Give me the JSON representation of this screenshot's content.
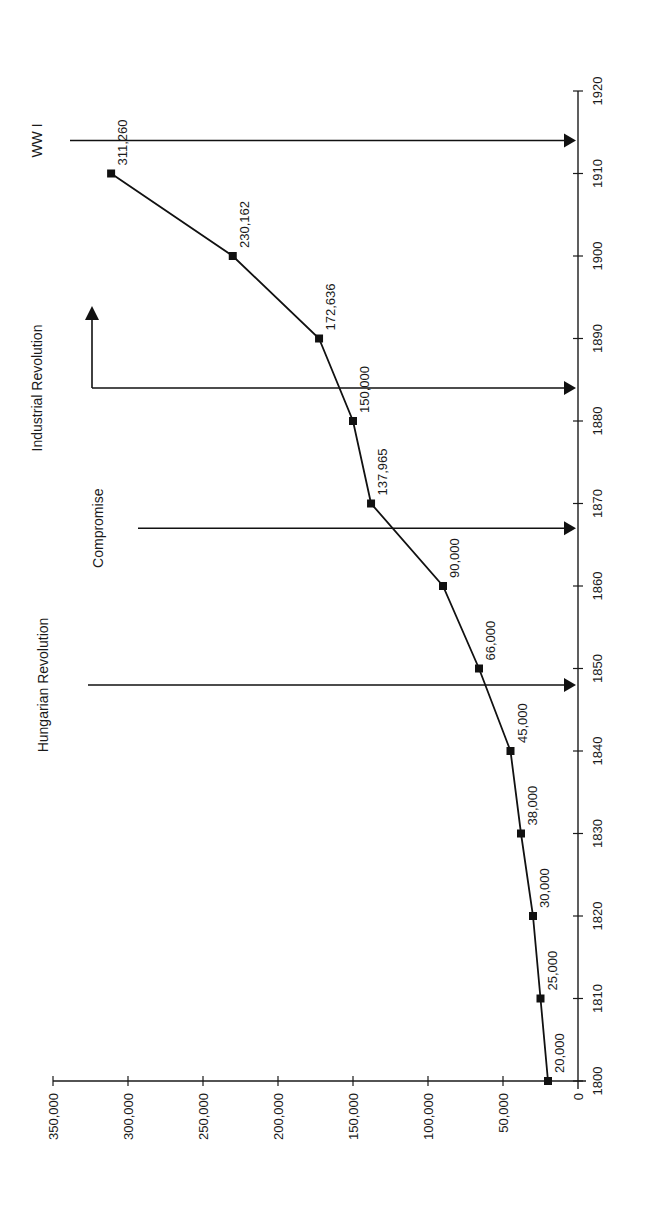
{
  "chart_data": {
    "type": "line",
    "orientation": "rotated-90-ccw",
    "title": "",
    "xlabel": "",
    "ylabel": "",
    "x": [
      1800,
      1810,
      1820,
      1830,
      1840,
      1850,
      1860,
      1870,
      1880,
      1890,
      1900,
      1910
    ],
    "series": [
      {
        "name": "Population",
        "values": [
          20000,
          25000,
          30000,
          38000,
          45000,
          66000,
          90000,
          137965,
          150000,
          172636,
          230162,
          311260
        ],
        "labels": [
          "20,000",
          "25,000",
          "30,000",
          "38,000",
          "45,000",
          "66,000",
          "90,000",
          "137,965",
          "150,000",
          "172,636",
          "230,162",
          "311,260"
        ],
        "marker": "square",
        "color": "#111111"
      }
    ],
    "xlim": [
      1800,
      1920
    ],
    "ylim": [
      0,
      350000
    ],
    "x_ticks": [
      "1800",
      "1810",
      "1820",
      "1830",
      "1840",
      "1850",
      "1860",
      "1870",
      "1880",
      "1890",
      "1900",
      "1910",
      "1920"
    ],
    "y_ticks": [
      "0",
      "50,000",
      "100,000",
      "150,000",
      "200,000",
      "250,000",
      "300,000",
      "350,000"
    ],
    "grid": false,
    "legend": null,
    "annotations": [
      {
        "label": "Hungarian Revolution",
        "year": 1848,
        "style": "arrow-to-axis"
      },
      {
        "label": "Compromise",
        "year": 1867,
        "style": "arrow-to-axis"
      },
      {
        "label": "Industrial Revolution",
        "year": 1884,
        "style": "double-arrow-bent"
      },
      {
        "label": "WW I",
        "year": 1914,
        "style": "arrow-to-axis"
      }
    ]
  }
}
